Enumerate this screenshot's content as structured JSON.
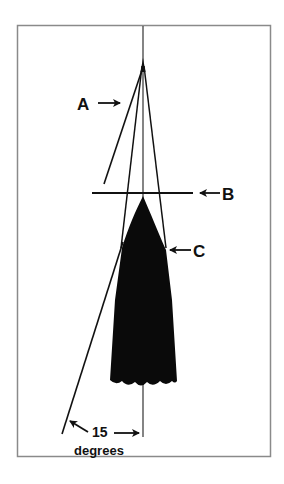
{
  "diagram": {
    "labels": {
      "a": "A",
      "b": "B",
      "c": "C",
      "angle_value": "15",
      "angle_unit": "degrees"
    },
    "colors": {
      "ink": "#111111",
      "frame": "#8a8a8a",
      "plumb_line": "#555555",
      "background": "#ffffff"
    },
    "geometry": {
      "frame": {
        "x": 17,
        "y": 25,
        "w": 254,
        "h": 432
      },
      "apex": [
        143,
        62
      ],
      "crossbar_y": 193,
      "angle_degrees": 15
    }
  }
}
